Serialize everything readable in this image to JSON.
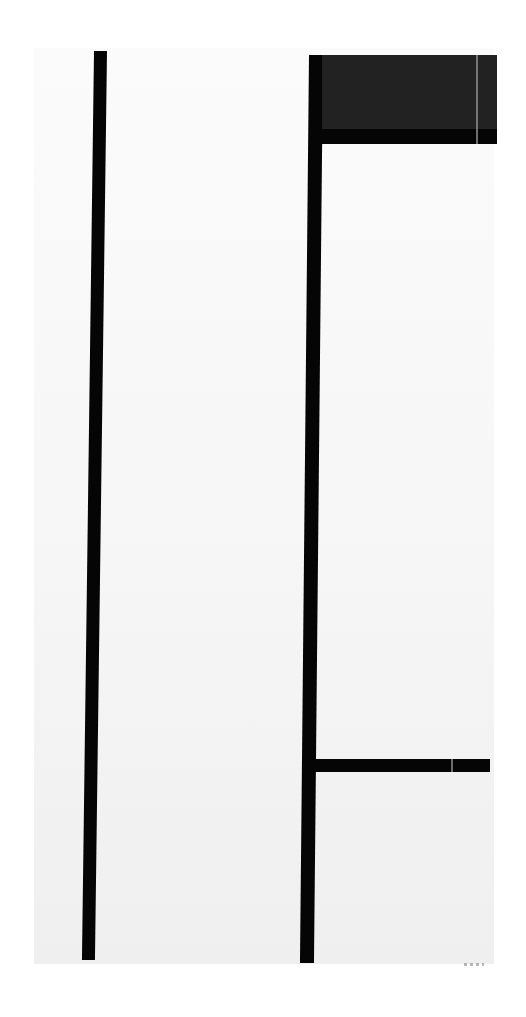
{
  "artwork": {
    "type": "abstract geometric composition",
    "colors": {
      "line": "#050505",
      "block": "#222222",
      "ground": "#f6f6f6",
      "background": "#ffffff"
    },
    "elements": [
      {
        "name": "left-vertical-line"
      },
      {
        "name": "right-vertical-line"
      },
      {
        "name": "dark-rectangle-top-right"
      },
      {
        "name": "upper-horizontal-line"
      },
      {
        "name": "lower-horizontal-line"
      }
    ]
  }
}
